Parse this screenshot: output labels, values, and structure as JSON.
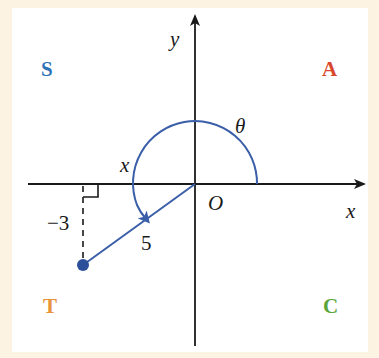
{
  "diagram": {
    "title": "",
    "quadrant_labels": {
      "second": {
        "text": "S",
        "color": "#2e73b8"
      },
      "first": {
        "text": "A",
        "color": "#d9472b"
      },
      "third": {
        "text": "T",
        "color": "#e8923a"
      },
      "fourth": {
        "text": "C",
        "color": "#5ba53a"
      }
    },
    "axes": {
      "x_label": "x",
      "y_label": "y",
      "origin_label": "O"
    },
    "angle_label": "θ",
    "reference_angle_label": "x",
    "side_labels": {
      "vertical": "−3",
      "hypotenuse": "5"
    },
    "colors": {
      "background": "#fdf3e2",
      "panel": "#ffffff",
      "accent": "#3a5ea8",
      "axis": "#1a1a1a"
    }
  }
}
